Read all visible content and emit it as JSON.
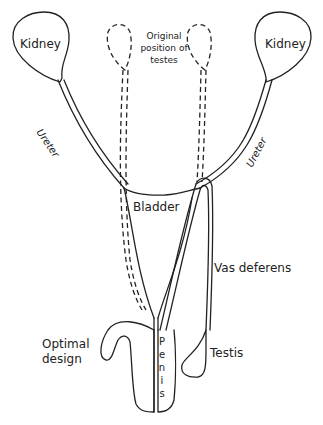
{
  "diagram": {
    "colors": {
      "stroke": "#222222",
      "background": "#ffffff",
      "text": "#222222"
    },
    "labels": {
      "kidney_left": "Kidney",
      "kidney_right": "Kidney",
      "original_position_line1": "Original",
      "original_position_line2": "position of",
      "original_position_line3": "testes",
      "ureter_left": "Ureter",
      "ureter_right": "Ureter",
      "bladder": "Bladder",
      "vas_deferens": "Vas deferens",
      "optimal_line1": "Optimal",
      "optimal_line2": "design",
      "testis": "Testis",
      "penis_letters": [
        "P",
        "e",
        "n",
        "i",
        "s"
      ]
    }
  }
}
